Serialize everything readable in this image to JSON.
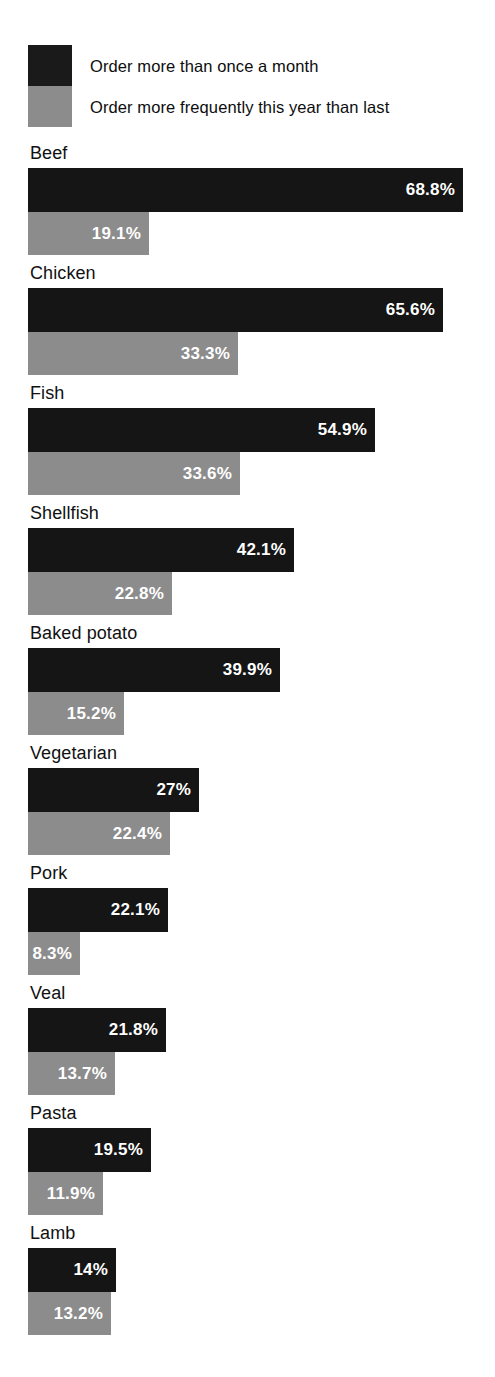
{
  "legend": {
    "items": [
      {
        "label": "Order more than once a month",
        "swatch": "dark",
        "color": "#151515"
      },
      {
        "label": "Order more frequently this year than last",
        "swatch": "gray",
        "color": "#8c8c8c"
      }
    ]
  },
  "chart_data": {
    "type": "bar",
    "orientation": "horizontal",
    "title": "",
    "subtitle": "",
    "xlabel": "",
    "ylabel": "",
    "grid": false,
    "legend_position": "top-left",
    "value_suffix": "%",
    "xlim": [
      0,
      70
    ],
    "categories": [
      "Beef",
      "Chicken",
      "Fish",
      "Shellfish",
      "Baked potato",
      "Vegetarian",
      "Pork",
      "Veal",
      "Pasta",
      "Lamb"
    ],
    "series": [
      {
        "name": "Order more than once a month",
        "color": "#151515",
        "values": [
          68.8,
          65.6,
          54.9,
          42.1,
          39.9,
          27,
          22.1,
          21.8,
          19.5,
          14
        ],
        "labels": [
          "68.8%",
          "65.6%",
          "54.9%",
          "42.1%",
          "39.9%",
          "27%",
          "22.1%",
          "21.8%",
          "19.5%",
          "14%"
        ]
      },
      {
        "name": "Order more frequently this year than last",
        "color": "#8c8c8c",
        "values": [
          19.1,
          33.3,
          33.6,
          22.8,
          15.2,
          22.4,
          8.3,
          13.7,
          11.9,
          13.2
        ],
        "labels": [
          "19.1%",
          "33.3%",
          "33.6%",
          "22.8%",
          "15.2%",
          "22.4%",
          "8.3%",
          "13.7%",
          "11.9%",
          "13.2%"
        ]
      }
    ]
  },
  "render": {
    "px_per_percent": 6.32,
    "bar_left_px": 28
  }
}
